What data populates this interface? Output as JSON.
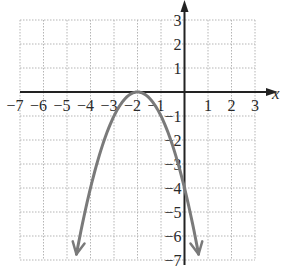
{
  "chart_data": {
    "type": "line",
    "title": "",
    "xlabel": "x",
    "ylabel": "y",
    "xlim": [
      -7,
      3
    ],
    "ylim": [
      -7,
      3
    ],
    "grid": true,
    "x_ticks": [
      "−7",
      "−6",
      "−5",
      "−4",
      "−3",
      "−2",
      "−1",
      "1",
      "2",
      "3"
    ],
    "y_ticks": [
      "3",
      "2",
      "1",
      "−1",
      "−2",
      "−3",
      "−4",
      "−5",
      "−6",
      "−7"
    ],
    "series": [
      {
        "name": "y = -(x+2)^2",
        "equation": "y = -(x + 2)^2",
        "vertex": [
          -2,
          0
        ],
        "y_intercept": [
          0,
          -4
        ],
        "x_range": [
          -4.6,
          0.6
        ],
        "color": "#7a7a7a",
        "points": [
          [
            -4.6,
            -6.76
          ],
          [
            -4,
            -4
          ],
          [
            -3,
            -1
          ],
          [
            -2,
            0
          ],
          [
            -1,
            -1
          ],
          [
            0,
            -4
          ],
          [
            0.6,
            -6.76
          ]
        ]
      }
    ]
  },
  "colors": {
    "grid": "#b5b5b5",
    "axis": "#222222",
    "curve": "#7a7a7a"
  }
}
